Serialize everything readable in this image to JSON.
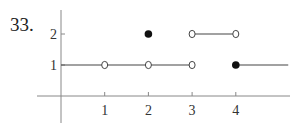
{
  "problem_number": "33.",
  "chart_data": {
    "type": "line",
    "title": "",
    "xlabel": "",
    "ylabel": "",
    "x_ticks": [
      1,
      2,
      3,
      4
    ],
    "y_ticks": [
      1,
      2
    ],
    "x_tick_labels": [
      "1",
      "2",
      "3",
      "4"
    ],
    "y_tick_labels": [
      "1",
      "2"
    ],
    "grid": false,
    "legend": null,
    "segments": [
      {
        "x_start": 0,
        "x_end": 3,
        "y": 1,
        "start_closed": true,
        "end_closed": false,
        "note": "starts at y-axis"
      },
      {
        "x_start": 3,
        "x_end": 4,
        "y": 2,
        "start_closed": false,
        "end_closed": false
      },
      {
        "x_start": 4,
        "x_end": 5.2,
        "y": 1,
        "start_closed": true,
        "end_closed": null,
        "note": "continues right"
      }
    ],
    "points": [
      {
        "x": 1,
        "y": 1,
        "style": "open"
      },
      {
        "x": 2,
        "y": 1,
        "style": "open"
      },
      {
        "x": 3,
        "y": 1,
        "style": "open"
      },
      {
        "x": 2,
        "y": 2,
        "style": "closed"
      },
      {
        "x": 3,
        "y": 2,
        "style": "open"
      },
      {
        "x": 4,
        "y": 2,
        "style": "open"
      },
      {
        "x": 4,
        "y": 1,
        "style": "closed"
      }
    ]
  },
  "colors": {
    "axis": "#888888",
    "line": "#444444",
    "point_fill": "#111111"
  }
}
